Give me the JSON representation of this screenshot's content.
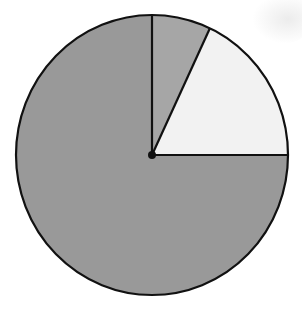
{
  "chart_data": {
    "type": "pie",
    "title": "",
    "start_angle_deg": 90,
    "direction": "clockwise",
    "slices": [
      {
        "label": "",
        "value": 7,
        "percent": 7,
        "color": "#a6a6a6"
      },
      {
        "label": "",
        "value": 18,
        "percent": 18,
        "color": "#f2f2f2"
      },
      {
        "label": "",
        "value": 75,
        "percent": 75,
        "color": "#999999"
      }
    ],
    "categories": [
      "Slice A",
      "Slice B",
      "Slice C"
    ],
    "values": [
      7,
      18,
      75
    ],
    "legend": "none",
    "labels_shown": false,
    "center_dot": true,
    "outline_color": "#111111"
  },
  "layout": {
    "cx": 152,
    "cy": 155,
    "rx": 136,
    "ry": 140,
    "stroke_width": 2.2,
    "center_dot_radius": 4
  }
}
